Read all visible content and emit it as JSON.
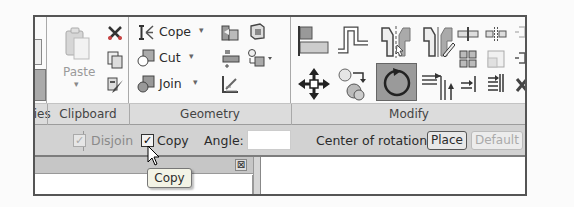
{
  "ribbon": {
    "panels": [
      {
        "label": "ties",
        "name": "properties"
      },
      {
        "label": "Clipboard",
        "name": "clipboard"
      },
      {
        "label": "Geometry",
        "name": "geometry"
      },
      {
        "label": "Modify",
        "name": "modify"
      }
    ],
    "clipboard": {
      "paste_label": "Paste",
      "paste_arrow": "▾",
      "tools": [
        "cut-icon",
        "copy-clipboard-icon",
        "match-properties-icon"
      ]
    },
    "geometry": {
      "cope_label": "Cope",
      "cut_label": "Cut",
      "join_label": "Join",
      "dropdown_arrow": "▾",
      "tools": [
        "cope-icon",
        "cut-geometry-icon",
        "join-icon",
        "wall-joins-icon",
        "split-face-icon",
        "demolish-icon",
        "paint-icon",
        "linework-icon"
      ]
    },
    "modify": {
      "tools": [
        "align-icon",
        "offset-icon",
        "mirror-pick-axis-icon",
        "mirror-draw-axis-icon",
        "move-icon",
        "copy-modify-icon",
        "rotate-icon",
        "trim-extend-corner-icon",
        "split-element-icon",
        "split-gap-icon",
        "array-icon",
        "scale-icon",
        "trim-extend-single-icon",
        "trim-extend-multiple-icon",
        "pin-icon",
        "unpin-icon",
        "delete-icon"
      ],
      "active_tool": "rotate-icon"
    }
  },
  "options_bar": {
    "disjoin_label": "Disjoin",
    "disjoin_checked": true,
    "copy_label": "Copy",
    "copy_checked": true,
    "angle_label": "Angle:",
    "angle_value": "",
    "center_label": "Center of rotation:",
    "place_button": "Place",
    "default_button": "Default"
  },
  "tooltip": {
    "text": "Copy"
  },
  "close_glyph": "⊠",
  "check_glyph": "✓"
}
